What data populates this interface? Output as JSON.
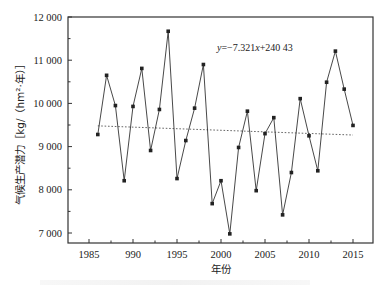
{
  "chart_data": {
    "type": "line",
    "title": "",
    "xlabel": "年份",
    "ylabel": "气候生产潜力［kg/（hm²·年）］",
    "xlim": [
      1982,
      2017
    ],
    "ylim": [
      6800,
      12000
    ],
    "grid": false,
    "legend": null,
    "x_ticks": [
      1985,
      1990,
      1995,
      2000,
      2005,
      2010,
      2015
    ],
    "x_tick_labels": [
      "1985",
      "990",
      "1995",
      "2000",
      "2005",
      "2010",
      "2015"
    ],
    "y_ticks": [
      7000,
      8000,
      9000,
      10000,
      11000,
      12000
    ],
    "y_tick_labels": [
      "7 000",
      "8 000",
      "9 000",
      "10 000",
      "11 000",
      "12 000"
    ],
    "series": [
      {
        "name": "气候生产潜力",
        "style": "solid line with square markers",
        "x": [
          1986,
          1987,
          1988,
          1989,
          1990,
          1991,
          1992,
          1993,
          1994,
          1995,
          1996,
          1997,
          1998,
          1999,
          2000,
          2001,
          2002,
          2003,
          2004,
          2005,
          2006,
          2007,
          2008,
          2009,
          2010,
          2011,
          2012,
          2013,
          2014,
          2015
        ],
        "values": [
          9280,
          10650,
          9950,
          8210,
          9930,
          10810,
          8910,
          9860,
          11670,
          8260,
          9140,
          9890,
          10900,
          7680,
          8210,
          6980,
          8980,
          9820,
          7980,
          9300,
          9670,
          7420,
          8400,
          10110,
          9250,
          8440,
          10490,
          11210,
          10330,
          9490
        ]
      },
      {
        "name": "线性趋势",
        "style": "dotted line",
        "x": [
          1986,
          2015
        ],
        "values": [
          9480,
          9268
        ]
      }
    ],
    "annotations": [
      {
        "text": "y=−7.321x+240 43",
        "x": 2000.5,
        "y": 11280
      }
    ]
  },
  "annotation": {
    "y_italic": "y",
    "eq_mid": "=−7.321",
    "x_italic": "x",
    "eq_tail": "+240 43"
  },
  "colors": {
    "line": "#333333",
    "marker": "#222222",
    "trend": "#666666",
    "axis": "#333333"
  }
}
